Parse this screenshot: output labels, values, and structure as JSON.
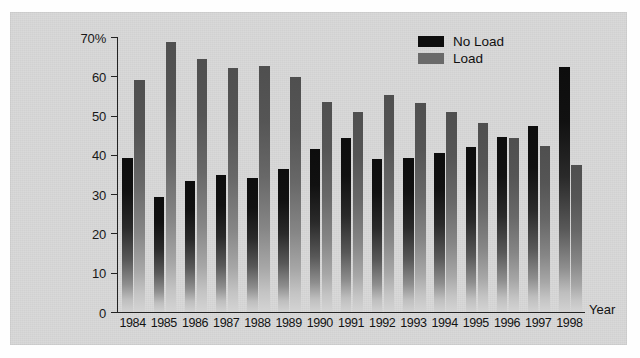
{
  "figure": {
    "panel_background": "#d7d7d7",
    "page_background": "#fefefe"
  },
  "legend": {
    "position": "upper-right-inside",
    "entries": [
      {
        "label": "No Load",
        "color": "#0e0e0e",
        "swatch_name": "legend-swatch-no-load"
      },
      {
        "label": "Load",
        "color": "#6a6a6a",
        "swatch_name": "legend-swatch-load"
      }
    ]
  },
  "axes": {
    "y_ticks": [
      "0",
      "10",
      "20",
      "30",
      "40",
      "50",
      "60",
      "70%"
    ],
    "x_title": "Year"
  },
  "chart_data": {
    "type": "bar",
    "title": "",
    "subtitle": "",
    "xlabel": "Year",
    "ylabel": "",
    "ylim": [
      0,
      70
    ],
    "ytick_values": [
      0,
      10,
      20,
      30,
      40,
      50,
      60,
      70
    ],
    "ytick_labels": [
      "0",
      "10",
      "20",
      "30",
      "40",
      "50",
      "60",
      "70%"
    ],
    "grid": false,
    "legend_position": "upper right",
    "units": "percent",
    "categories": [
      "1984",
      "1985",
      "1986",
      "1987",
      "1988",
      "1989",
      "1990",
      "1991",
      "1992",
      "1993",
      "1994",
      "1995",
      "1996",
      "1997",
      "1998"
    ],
    "series": [
      {
        "name": "No Load",
        "color": "#0e0e0e",
        "values": [
          39.3,
          29.3,
          33.3,
          35.0,
          34.2,
          36.3,
          41.5,
          44.3,
          39.0,
          39.3,
          40.5,
          42.0,
          44.5,
          47.3,
          62.3
        ]
      },
      {
        "name": "Load",
        "color": "#6a6a6a",
        "values": [
          59.0,
          68.7,
          64.3,
          62.0,
          62.5,
          59.8,
          53.5,
          50.8,
          55.3,
          53.2,
          50.9,
          48.2,
          44.4,
          42.3,
          37.5
        ]
      }
    ],
    "annotations": []
  }
}
